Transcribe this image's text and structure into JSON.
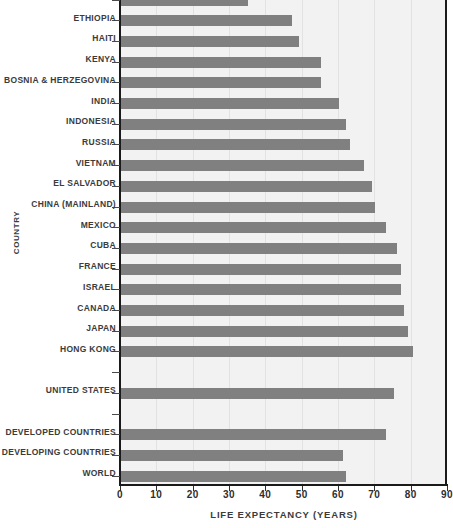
{
  "chart_data": {
    "type": "bar",
    "orientation": "horizontal",
    "title": "",
    "xlabel": "Life Expectancy (Years)",
    "ylabel": "Country",
    "xlim": [
      0,
      90
    ],
    "xticks": [
      0,
      10,
      20,
      30,
      40,
      50,
      60,
      70,
      80,
      90
    ],
    "grid": true,
    "legend": null,
    "bar_color": "#808080",
    "plot_background": "#f2f2f2",
    "axis_color": "#1a1a1a",
    "categories": [
      "Zambia",
      "Ethiopia",
      "Haiti",
      "Kenya",
      "Bosnia & Herzegovina",
      "India",
      "Indonesia",
      "Russia",
      "Vietnam",
      "El Salvador",
      "China (Mainland)",
      "Mexico",
      "Cuba",
      "France",
      "Israel",
      "Canada",
      "Japan",
      "Hong Kong",
      "",
      "United States",
      "",
      "Developed Countries",
      "Developing Countries",
      "World"
    ],
    "values": [
      35,
      47,
      49,
      55,
      55,
      60,
      62,
      63,
      67,
      69,
      70,
      73,
      76,
      77,
      77,
      78,
      79,
      80.5,
      null,
      75,
      null,
      73,
      61,
      62
    ]
  }
}
